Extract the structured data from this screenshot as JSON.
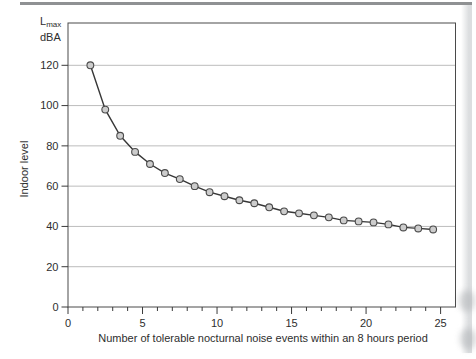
{
  "figure": {
    "y_unit_main": "L",
    "y_unit_sub": "max",
    "y_unit_line2": "dBA",
    "y_axis_title": "Indoor level",
    "x_axis_title": "Number of tolerable nocturnal noise events within an 8 hours period"
  },
  "colors": {
    "frame": "#4a4a4a",
    "grid": "#bcbcbc",
    "tick": "#3a3a3a",
    "text": "#2e2e2e",
    "line": "#373737",
    "marker_fill": "#cccccc",
    "marker_stroke": "#4a4a4a",
    "scan_top_rule": "#8f9193",
    "scan_edge_shade": "#dcdee0"
  },
  "chart_data": {
    "type": "line",
    "title": "",
    "xlabel": "Number of tolerable nocturnal noise events within an 8 hours period",
    "ylabel": "Indoor level",
    "y_unit": "Lmax dBA",
    "xlim": [
      0,
      26
    ],
    "ylim": [
      0,
      141
    ],
    "x_major_ticks": [
      0,
      5,
      10,
      15,
      20,
      25
    ],
    "x_minor_tick_step": 1,
    "y_major_ticks": [
      0,
      20,
      40,
      60,
      80,
      100,
      120
    ],
    "grid_y_values": [
      20,
      40,
      60,
      80,
      100,
      120
    ],
    "grid": "horizontal-only",
    "legend": "none",
    "series": [
      {
        "name": "tolerable-indoor-Lmax",
        "marker": "circle",
        "x": [
          1.5,
          2.5,
          3.5,
          4.5,
          5.5,
          6.5,
          7.5,
          8.5,
          9.5,
          10.5,
          11.5,
          12.5,
          13.5,
          14.5,
          15.5,
          16.5,
          17.5,
          18.5,
          19.5,
          20.5,
          21.5,
          22.5,
          23.5,
          24.5
        ],
        "y": [
          120,
          98,
          85,
          77,
          71,
          66.5,
          63.5,
          60,
          57,
          55,
          53,
          51.5,
          49.5,
          47.5,
          46.5,
          45.5,
          44.5,
          43,
          42.5,
          42,
          41,
          39.5,
          39,
          38.5
        ]
      }
    ]
  }
}
